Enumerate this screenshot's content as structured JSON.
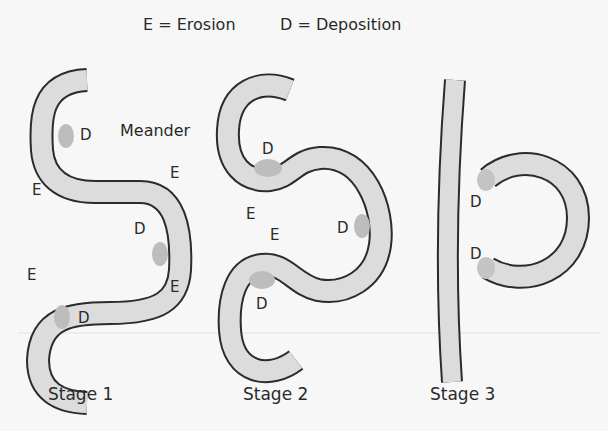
{
  "legend": {
    "erosion": "E = Erosion",
    "deposition": "D = Deposition"
  },
  "labels": {
    "meander": "Meander",
    "E": "E",
    "D": "D"
  },
  "stages": [
    {
      "label": "Stage 1"
    },
    {
      "label": "Stage 2"
    },
    {
      "label": "Stage 3"
    }
  ],
  "colors": {
    "background": "#f7f7f7",
    "channel_fill": "#dcdcdc",
    "channel_outline": "#2b2b2b",
    "deposition_patch": "#bdbdbd",
    "text": "#2a2a2a"
  }
}
